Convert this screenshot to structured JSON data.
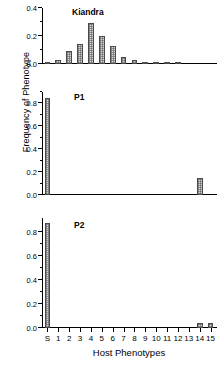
{
  "figure": {
    "xlabel": "Host Phenotypes",
    "ylabel": "Frequency of Phenotype"
  },
  "chart_data": [
    {
      "type": "bar",
      "title": "Kiandra",
      "panel": "top",
      "xlabel": "Host Phenotypes",
      "ylabel": "Frequency of Phenotype",
      "categories": [
        "S",
        "1",
        "2",
        "3",
        "4",
        "5",
        "6",
        "7",
        "8",
        "9",
        "10",
        "11",
        "12",
        "13",
        "14",
        "15"
      ],
      "values": [
        0.005,
        0.03,
        0.09,
        0.145,
        0.29,
        0.2,
        0.13,
        0.05,
        0.03,
        0.012,
        0.012,
        0.012,
        0.012,
        0.0,
        0.0,
        0.0
      ],
      "ylim": [
        0.0,
        0.4
      ],
      "yticks_major": [
        0.0,
        0.2,
        0.4
      ],
      "ytick_labels": [
        "0.0",
        "0.2",
        "0.4"
      ],
      "yticks_minor": [
        0.1,
        0.3
      ],
      "grid": false,
      "legend": "none"
    },
    {
      "type": "bar",
      "title": "P1",
      "panel": "middle",
      "xlabel": "Host Phenotypes",
      "ylabel": "Frequency of Phenotype",
      "categories": [
        "S",
        "1",
        "2",
        "3",
        "4",
        "5",
        "6",
        "7",
        "8",
        "9",
        "10",
        "11",
        "12",
        "13",
        "14",
        "15"
      ],
      "values": [
        0.85,
        0.0,
        0.0,
        0.0,
        0.0,
        0.0,
        0.0,
        0.0,
        0.0,
        0.0,
        0.0,
        0.0,
        0.0,
        0.0,
        0.15,
        0.0
      ],
      "ylim": [
        0.0,
        0.9
      ],
      "yticks_major": [
        0.0,
        0.2,
        0.4,
        0.6,
        0.8
      ],
      "ytick_labels": [
        "0.0",
        "0.2",
        "0.4",
        "0.6",
        "0.8"
      ],
      "yticks_minor": [
        0.1,
        0.3,
        0.5,
        0.7,
        0.9
      ],
      "grid": false,
      "legend": "none"
    },
    {
      "type": "bar",
      "title": "P2",
      "panel": "bottom",
      "xlabel": "Host Phenotypes",
      "ylabel": "Frequency of Phenotype",
      "categories": [
        "S",
        "1",
        "2",
        "3",
        "4",
        "5",
        "6",
        "7",
        "8",
        "9",
        "10",
        "11",
        "12",
        "13",
        "14",
        "15"
      ],
      "values": [
        0.88,
        0.0,
        0.0,
        0.0,
        0.0,
        0.0,
        0.0,
        0.0,
        0.0,
        0.0,
        0.0,
        0.0,
        0.0,
        0.0,
        0.04,
        0.04
      ],
      "ylim": [
        0.0,
        0.92
      ],
      "yticks_major": [
        0.0,
        0.2,
        0.4,
        0.6,
        0.8
      ],
      "ytick_labels": [
        "0.0",
        "0.2",
        "0.4",
        "0.6",
        "0.8"
      ],
      "yticks_minor": [
        0.1,
        0.3,
        0.5,
        0.7
      ],
      "grid": false,
      "legend": "none"
    }
  ]
}
